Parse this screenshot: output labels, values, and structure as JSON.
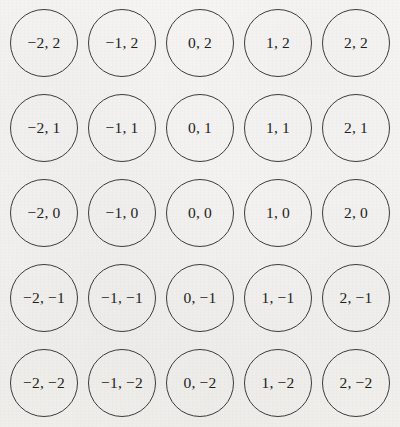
{
  "figure": {
    "type": "integer-lattice-diagram",
    "background_color": "#f4f3f1",
    "circle_stroke_color": "#3b3b3d",
    "label_color": "#1e1e20",
    "columns": 5,
    "rows": 5
  },
  "chart_data": {
    "type": "scatter",
    "title": "",
    "subtitle": "",
    "xlabel": "",
    "ylabel": "",
    "xlim": [
      -2,
      2
    ],
    "ylim": [
      -2,
      2
    ],
    "grid": false,
    "legend": null,
    "x_tick_labels": [
      "-2",
      "-1",
      "0",
      "1",
      "2"
    ],
    "y_tick_labels": [
      "2",
      "1",
      "0",
      "-1",
      "-2"
    ],
    "marker": "open-circle",
    "points": [
      {
        "x": -2,
        "y": 2,
        "label": "−2, 2",
        "row": 0,
        "col": 0
      },
      {
        "x": -1,
        "y": 2,
        "label": "−1, 2",
        "row": 0,
        "col": 1
      },
      {
        "x": 0,
        "y": 2,
        "label": "0, 2",
        "row": 0,
        "col": 2
      },
      {
        "x": 1,
        "y": 2,
        "label": "1, 2",
        "row": 0,
        "col": 3
      },
      {
        "x": 2,
        "y": 2,
        "label": "2, 2",
        "row": 0,
        "col": 4
      },
      {
        "x": -2,
        "y": 1,
        "label": "−2, 1",
        "row": 1,
        "col": 0
      },
      {
        "x": -1,
        "y": 1,
        "label": "−1, 1",
        "row": 1,
        "col": 1
      },
      {
        "x": 0,
        "y": 1,
        "label": "0, 1",
        "row": 1,
        "col": 2
      },
      {
        "x": 1,
        "y": 1,
        "label": "1, 1",
        "row": 1,
        "col": 3
      },
      {
        "x": 2,
        "y": 1,
        "label": "2, 1",
        "row": 1,
        "col": 4
      },
      {
        "x": -2,
        "y": 0,
        "label": "−2, 0",
        "row": 2,
        "col": 0
      },
      {
        "x": -1,
        "y": 0,
        "label": "−1, 0",
        "row": 2,
        "col": 1
      },
      {
        "x": 0,
        "y": 0,
        "label": "0, 0",
        "row": 2,
        "col": 2
      },
      {
        "x": 1,
        "y": 0,
        "label": "1, 0",
        "row": 2,
        "col": 3
      },
      {
        "x": 2,
        "y": 0,
        "label": "2, 0",
        "row": 2,
        "col": 4
      },
      {
        "x": -2,
        "y": -1,
        "label": "−2, −1",
        "row": 3,
        "col": 0
      },
      {
        "x": -1,
        "y": -1,
        "label": "−1, −1",
        "row": 3,
        "col": 1
      },
      {
        "x": 0,
        "y": -1,
        "label": "0, −1",
        "row": 3,
        "col": 2
      },
      {
        "x": 1,
        "y": -1,
        "label": "1, −1",
        "row": 3,
        "col": 3
      },
      {
        "x": 2,
        "y": -1,
        "label": "2, −1",
        "row": 3,
        "col": 4
      },
      {
        "x": -2,
        "y": -2,
        "label": "−2, −2",
        "row": 4,
        "col": 0
      },
      {
        "x": -1,
        "y": -2,
        "label": "−1, −2",
        "row": 4,
        "col": 1
      },
      {
        "x": 0,
        "y": -2,
        "label": "0, −2",
        "row": 4,
        "col": 2
      },
      {
        "x": 1,
        "y": -2,
        "label": "1, −2",
        "row": 4,
        "col": 3
      },
      {
        "x": 2,
        "y": -2,
        "label": "2, −2",
        "row": 4,
        "col": 4
      }
    ]
  },
  "layout": {
    "column_centers_px": [
      44,
      122,
      200,
      278,
      356
    ],
    "row_centers_px": [
      43,
      128,
      213,
      298,
      383
    ],
    "circle_diameter_px": 68
  }
}
